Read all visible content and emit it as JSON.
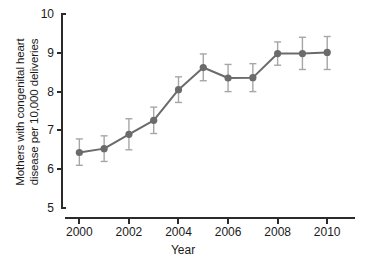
{
  "chart_data": {
    "type": "line",
    "title": "",
    "xlabel": "Year",
    "ylabel": "Mothers with congenital heart disease per 10,000 deliveries",
    "ylabel_lines": [
      "Mothers with congenital heart",
      "disease per 10,000 deliveries"
    ],
    "x": [
      2000,
      2001,
      2002,
      2003,
      2004,
      2005,
      2006,
      2007,
      2008,
      2009,
      2010
    ],
    "values": [
      6.43,
      6.53,
      6.9,
      7.26,
      8.05,
      8.62,
      8.35,
      8.36,
      8.98,
      8.98,
      9.01
    ],
    "error_low": [
      6.1,
      6.2,
      6.5,
      6.92,
      7.72,
      8.28,
      8.0,
      8.0,
      8.68,
      8.57,
      8.57
    ],
    "error_high": [
      6.78,
      6.86,
      7.3,
      7.6,
      8.38,
      8.97,
      8.7,
      8.72,
      9.28,
      9.4,
      9.42
    ],
    "xlim": [
      1999.3,
      2011.0
    ],
    "ylim": [
      5,
      10
    ],
    "ytick_labels": [
      "10",
      "9",
      "8",
      "7",
      "6",
      "5"
    ],
    "ytick_values": [
      10,
      9,
      8,
      7,
      6,
      5
    ],
    "xtick_labels": [
      "2000",
      "2002",
      "2004",
      "2006",
      "2008",
      "2010"
    ],
    "xtick_values": [
      2000,
      2002,
      2004,
      2006,
      2008,
      2010
    ],
    "grid": false,
    "legend": false,
    "marker": "circle",
    "series_color": "#6b6b6b",
    "errorbar_color": "#a6a6a6",
    "axis_color": "#2b2b2b",
    "background_color": "#ffffff"
  }
}
